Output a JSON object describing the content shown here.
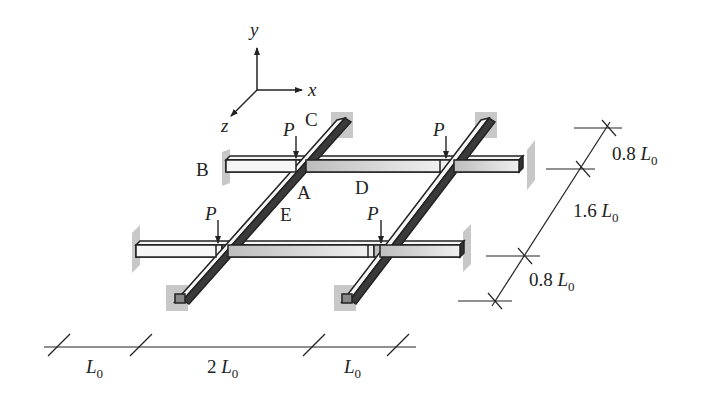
{
  "axes": {
    "x": "x",
    "y": "y",
    "z": "z"
  },
  "points": {
    "A": "A",
    "B": "B",
    "C": "C",
    "D": "D",
    "E": "E"
  },
  "loads": {
    "label": "P",
    "count": 4
  },
  "dimensions": {
    "bottom": [
      {
        "coef": "",
        "sym": "L",
        "sub": "0"
      },
      {
        "coef": "2 ",
        "sym": "L",
        "sub": "0"
      },
      {
        "coef": "",
        "sym": "L",
        "sub": "0"
      }
    ],
    "right": [
      {
        "coef": "0.8 ",
        "sym": "L",
        "sub": "0"
      },
      {
        "coef": "1.6 ",
        "sym": "L",
        "sub": "0"
      },
      {
        "coef": "0.8 ",
        "sym": "L",
        "sub": "0"
      }
    ]
  },
  "colors": {
    "beam_light": "#f4f4f4",
    "beam_dark": "#3a3a3a",
    "support": "#c8c8c8",
    "line": "#222222"
  }
}
